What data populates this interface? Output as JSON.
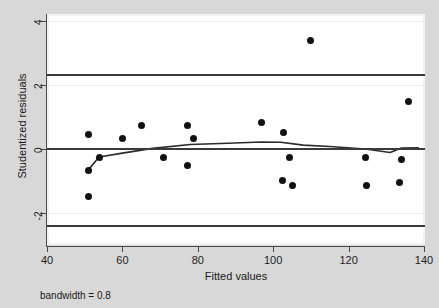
{
  "chart_data": {
    "type": "scatter",
    "title": "",
    "xlabel": "Fitted values",
    "ylabel": "Studentized residuals",
    "xlim": [
      40,
      140
    ],
    "ylim": [
      -2.6,
      4.3
    ],
    "xticks": [
      40,
      60,
      80,
      100,
      120,
      140
    ],
    "yticks": [
      4,
      2,
      0,
      -2
    ],
    "grid": true,
    "grid_color": "#ebebeb",
    "legend": "none",
    "point_color": "#111111",
    "line_color": "#2b2b2b",
    "points": [
      {
        "x": 50.9,
        "y": -0.66
      },
      {
        "x": 50.9,
        "y": -1.47
      },
      {
        "x": 53.8,
        "y": -0.25
      },
      {
        "x": 50.9,
        "y": 0.44
      },
      {
        "x": 59.9,
        "y": 0.34
      },
      {
        "x": 65.0,
        "y": 0.75
      },
      {
        "x": 70.8,
        "y": -0.25
      },
      {
        "x": 77.4,
        "y": 0.75
      },
      {
        "x": 78.9,
        "y": 0.34
      },
      {
        "x": 77.4,
        "y": -0.5
      },
      {
        "x": 96.8,
        "y": 0.84
      },
      {
        "x": 102.6,
        "y": 0.53
      },
      {
        "x": 109.8,
        "y": 3.38
      },
      {
        "x": 104.4,
        "y": -0.28
      },
      {
        "x": 102.4,
        "y": -0.97
      },
      {
        "x": 105.0,
        "y": -1.13
      },
      {
        "x": 124.4,
        "y": -0.28
      },
      {
        "x": 134.0,
        "y": -0.34
      },
      {
        "x": 124.7,
        "y": -1.13
      },
      {
        "x": 133.5,
        "y": -1.06
      },
      {
        "x": 136.0,
        "y": 1.47
      }
    ],
    "lowess_line": [
      {
        "x": 50.9,
        "y": -0.66
      },
      {
        "x": 53.8,
        "y": -0.25
      },
      {
        "x": 60.0,
        "y": -0.13
      },
      {
        "x": 68.0,
        "y": 0.02
      },
      {
        "x": 78.0,
        "y": 0.14
      },
      {
        "x": 88.0,
        "y": 0.18
      },
      {
        "x": 96.8,
        "y": 0.22
      },
      {
        "x": 102.0,
        "y": 0.21
      },
      {
        "x": 108.0,
        "y": 0.12
      },
      {
        "x": 115.0,
        "y": 0.08
      },
      {
        "x": 124.4,
        "y": 0.0
      },
      {
        "x": 131.0,
        "y": -0.11
      },
      {
        "x": 134.0,
        "y": 0.03
      },
      {
        "x": 138.5,
        "y": 0.04
      }
    ],
    "reference_lines": [
      {
        "y": 2.3,
        "style": "solid",
        "color": "#3a3a3a"
      },
      {
        "y": 0.0,
        "style": "solid",
        "color": "#3a3a3a"
      },
      {
        "y": -2.4,
        "style": "solid",
        "color": "#3a3a3a"
      }
    ],
    "annotations": [
      {
        "text": "bandwidth = 0.8",
        "position": "below-axis-left"
      }
    ]
  },
  "axes": {
    "x_title": "Fitted values",
    "y_title": "Studentized residuals",
    "x_tick_labels": [
      "40",
      "60",
      "80",
      "100",
      "120",
      "140"
    ],
    "y_tick_labels": [
      "4",
      "2",
      "0",
      "-2"
    ]
  },
  "footer": {
    "bandwidth_note": "bandwidth = 0.8"
  }
}
